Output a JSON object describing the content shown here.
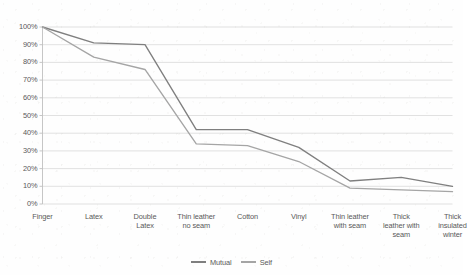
{
  "chart_data": {
    "type": "line",
    "title": "",
    "subtitle": "",
    "xlabel": "",
    "ylabel": "",
    "ylim": [
      0,
      100
    ],
    "yticks": [
      0,
      10,
      20,
      30,
      40,
      50,
      60,
      70,
      80,
      90,
      100
    ],
    "ytick_labels": [
      "0%",
      "10%",
      "20%",
      "30%",
      "40%",
      "50%",
      "60%",
      "70%",
      "80%",
      "90%",
      "100%"
    ],
    "grid": "horizontal",
    "legend_position": "bottom-center",
    "categories": [
      "Finger",
      "Latex",
      "Double Latex",
      "Thin leather no seam",
      "Cotton",
      "Vinyl",
      "Thin leather with seam",
      "Thick leather with seam",
      "Thick insulated winter"
    ],
    "category_label_lines": [
      [
        "Finger"
      ],
      [
        "Latex"
      ],
      [
        "Double",
        "Latex"
      ],
      [
        "Thin leather",
        "no seam"
      ],
      [
        "Cotton"
      ],
      [
        "Vinyl"
      ],
      [
        "Thin leather",
        "with seam"
      ],
      [
        "Thick",
        "leather with",
        "seam"
      ],
      [
        "Thick",
        "insulated",
        "winter"
      ]
    ],
    "series": [
      {
        "name": "Mutual",
        "color": "#7f7f7f",
        "values": [
          100,
          91,
          90,
          42,
          42,
          32,
          13,
          15,
          10
        ]
      },
      {
        "name": "Self",
        "color": "#a5a5a5",
        "values": [
          100,
          83,
          76,
          34,
          33,
          24,
          9,
          8,
          7
        ]
      }
    ]
  },
  "axes": {
    "ytick_labels": [
      "100%",
      "90%",
      "80%",
      "70%",
      "60%",
      "50%",
      "40%",
      "30%",
      "20%",
      "10%",
      "0%"
    ]
  },
  "legend": {
    "items": [
      {
        "label": "Mutual",
        "color": "#7f7f7f"
      },
      {
        "label": "Self",
        "color": "#a5a5a5"
      }
    ]
  }
}
